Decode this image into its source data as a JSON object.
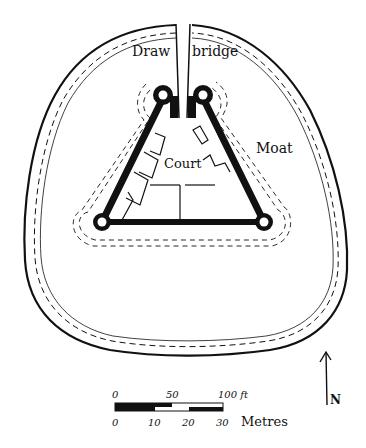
{
  "diagram": {
    "type": "castle-plan",
    "labels": {
      "drawbridge_left": "Draw",
      "drawbridge_right": "bridge",
      "court": "Court",
      "moat": "Moat",
      "north": "N"
    },
    "scale_bar": {
      "feet_ticks": [
        "0",
        "50",
        "100 ft"
      ],
      "metre_ticks": [
        "0",
        "10",
        "20",
        "30"
      ],
      "metre_unit": "Metres"
    },
    "colors": {
      "ink": "#111111",
      "paper": "#ffffff"
    }
  }
}
